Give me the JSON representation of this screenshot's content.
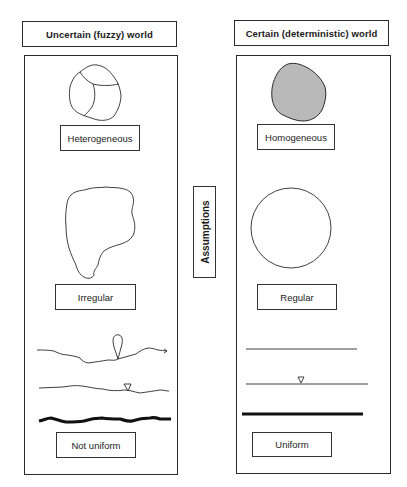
{
  "left_column": {
    "title": "Uncertain (fuzzy) world",
    "labels": {
      "shape_composition": "Heterogeneous",
      "shape_geometry": "Irregular",
      "surface_layers": "Not uniform"
    }
  },
  "right_column": {
    "title": "Certain (deterministic) world",
    "labels": {
      "shape_composition": "Homogeneous",
      "shape_geometry": "Regular",
      "surface_layers": "Uniform"
    }
  },
  "center": {
    "label": "Assumptions"
  },
  "colors": {
    "stroke": "#2a2a2a",
    "homogeneous_fill": "#b9b9b9",
    "background": "#ffffff"
  }
}
